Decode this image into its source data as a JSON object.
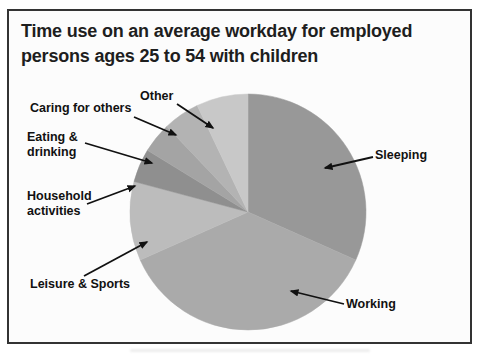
{
  "header": {
    "title_line1": "Time use on an average workday for employed",
    "title_line2": "persons ages 25 to 54 with children"
  },
  "frame": {
    "border_color": "#333333",
    "background": "#fcfcfc"
  },
  "chart_data": {
    "type": "pie",
    "title": "Time use on an average workday for employed persons ages 25 to 54 with children",
    "unit": "hours per 24-hour average workday (estimated from slice angles)",
    "total_hours": 24,
    "direction": "clockwise",
    "start_angle": "12 o'clock",
    "legend_position": "none (callout labels with arrows)",
    "grid": "off",
    "slices": [
      {
        "label": "Sleeping",
        "hours": 7.6,
        "percent": 31.7,
        "angle_deg": 114.0,
        "color": "#989898"
      },
      {
        "label": "Working",
        "hours": 8.8,
        "percent": 36.7,
        "angle_deg": 132.0,
        "color": "#aaaaaa"
      },
      {
        "label": "Leisure & Sports",
        "hours": 2.6,
        "percent": 10.8,
        "angle_deg": 39.0,
        "color": "#bcbcbc"
      },
      {
        "label": "Household activities",
        "hours": 1.1,
        "percent": 4.6,
        "angle_deg": 16.5,
        "color": "#8f8f8f"
      },
      {
        "label": "Eating & drinking",
        "hours": 1.0,
        "percent": 4.2,
        "angle_deg": 15.0,
        "color": "#a4a4a4"
      },
      {
        "label": "Caring for others",
        "hours": 1.2,
        "percent": 5.0,
        "angle_deg": 18.0,
        "color": "#b3b3b3"
      },
      {
        "label": "Other",
        "hours": 1.7,
        "percent": 7.1,
        "angle_deg": 25.5,
        "color": "#c8c8c8"
      }
    ]
  }
}
